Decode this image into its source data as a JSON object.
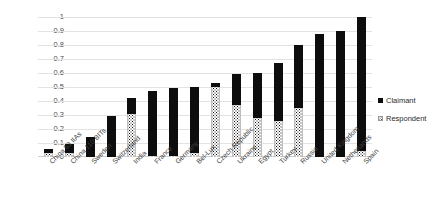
{
  "chart_data": {
    "type": "bar",
    "title": "",
    "xlabel": "",
    "ylabel": "",
    "ylim": [
      0,
      1
    ],
    "grid": true,
    "stacked": true,
    "legend_position": "right",
    "categories": [
      "China 53 IIAs",
      "China 110 BITs",
      "Sweden",
      "Switzerland",
      "India",
      "France",
      "Germany",
      "Bel-Lux",
      "Czech Republic",
      "Ukraine",
      "Egypt",
      "Turkey",
      "Russia",
      "United Kingdom",
      "Netherlands",
      "Spain"
    ],
    "series": [
      {
        "name": "Claimant",
        "color": "#0d0d0d",
        "values": [
          0.03,
          0.06,
          0.14,
          0.29,
          0.11,
          0.46,
          0.48,
          0.47,
          0.03,
          0.22,
          0.32,
          0.41,
          0.45,
          0.88,
          0.9,
          0.96
        ]
      },
      {
        "name": "Respondent",
        "color": "#ffffff",
        "pattern": "dotted",
        "values": [
          0.03,
          0.03,
          0.0,
          0.0,
          0.31,
          0.01,
          0.01,
          0.03,
          0.5,
          0.37,
          0.28,
          0.26,
          0.35,
          0.0,
          0.0,
          0.04
        ]
      }
    ],
    "totals": [
      0.06,
      0.09,
      0.14,
      0.29,
      0.42,
      0.47,
      0.49,
      0.5,
      0.53,
      0.59,
      0.6,
      0.67,
      0.8,
      0.88,
      0.9,
      1.0
    ],
    "ytick_labels": [
      "1",
      "0.9",
      "0.8",
      "0.7",
      "0.6",
      "0.5",
      "0.4",
      "0.3",
      "0.2",
      "0.1",
      "0"
    ],
    "ytick_values": [
      1,
      0.9,
      0.8,
      0.7,
      0.6,
      0.5,
      0.4,
      0.3,
      0.2,
      0.1,
      0
    ]
  },
  "legend": {
    "items": [
      {
        "label": "Claimant",
        "swatch": "solid-black-square-icon"
      },
      {
        "label": "Respondent",
        "swatch": "dotted-square-icon"
      }
    ]
  }
}
